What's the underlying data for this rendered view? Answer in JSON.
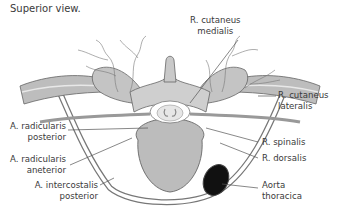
{
  "figure": {
    "caption": "Superior view.",
    "colors": {
      "bone": "#c8c8c8",
      "bone_dark": "#8a8a8a",
      "vessel": "#6a6a6a",
      "aorta": "#111111",
      "leader": "#555555",
      "text": "#3a3a3a"
    }
  },
  "labels": {
    "r_cutaneus_medialis": {
      "line1": "R. cutaneus",
      "line2": "medialis"
    },
    "r_cutaneus_lateralis": {
      "line1": "R. cutaneus",
      "line2": "lateralis"
    },
    "a_radicularis_posterior": {
      "line1": "A. radicularis",
      "line2": "posterior"
    },
    "a_radicularis_anterior": {
      "line1": "A. radicularis",
      "line2": "aneterior"
    },
    "r_spinalis": {
      "line1": "R. spinalis"
    },
    "r_dorsalis": {
      "line1": "R. dorsalis"
    },
    "a_intercostalis_posterior": {
      "line1": "A. intercostalis",
      "line2": "posterior"
    },
    "aorta_thoracica": {
      "line1": "Aorta",
      "line2": "thoracica"
    }
  }
}
